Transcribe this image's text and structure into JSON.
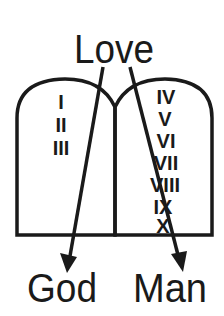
{
  "diagram": {
    "top_label": "Love",
    "bottom_left_label": "God",
    "bottom_right_label": "Man",
    "left_tablet": {
      "numerals": [
        "I",
        "II",
        "III"
      ]
    },
    "right_tablet": {
      "numerals": [
        "IV",
        "V",
        "VI",
        "VII",
        "VIII",
        "IX",
        "X"
      ]
    },
    "arrows": [
      {
        "from": "Love",
        "to": "God"
      },
      {
        "from": "Love",
        "to": "Man"
      }
    ],
    "colors": {
      "stroke": "#1a1a1a",
      "background": "#ffffff"
    }
  }
}
